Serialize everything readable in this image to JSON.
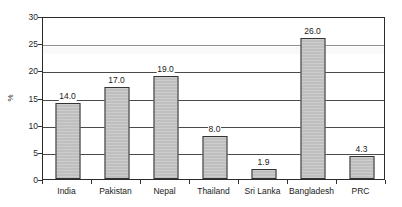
{
  "chart_data": {
    "type": "bar",
    "title": "",
    "xlabel": "",
    "ylabel": "%",
    "categories": [
      "India",
      "Pakistan",
      "Nepal",
      "Thailand",
      "Sri Lanka",
      "Bangladesh",
      "PRC"
    ],
    "values": [
      14.0,
      17.0,
      19.0,
      8.0,
      1.9,
      26.0,
      4.3
    ],
    "data_labels": [
      "14.0",
      "17.0",
      "19.0",
      "8.0",
      "1.9",
      "26.0",
      "4.3"
    ],
    "ylim": [
      0,
      30
    ],
    "ytick_values": [
      0,
      5,
      10,
      15,
      20,
      25,
      30
    ],
    "ytick_labels": [
      "0",
      "5",
      "10",
      "15",
      "20",
      "25",
      "30"
    ],
    "grid": true,
    "grid_orientation": "horizontal",
    "legend": false,
    "legend_position": "none",
    "series": [
      {
        "name": "",
        "values": [
          14.0,
          17.0,
          19.0,
          8.0,
          1.9,
          26.0,
          4.3
        ]
      }
    ]
  },
  "style": {
    "bar_fill": "#BFBFBF",
    "bar_border": "#333333",
    "axis_color": "#2B2B2B",
    "grid_color": "#4A4A4A",
    "text_color": "#1A1A1A",
    "background": "#FFFFFF"
  }
}
